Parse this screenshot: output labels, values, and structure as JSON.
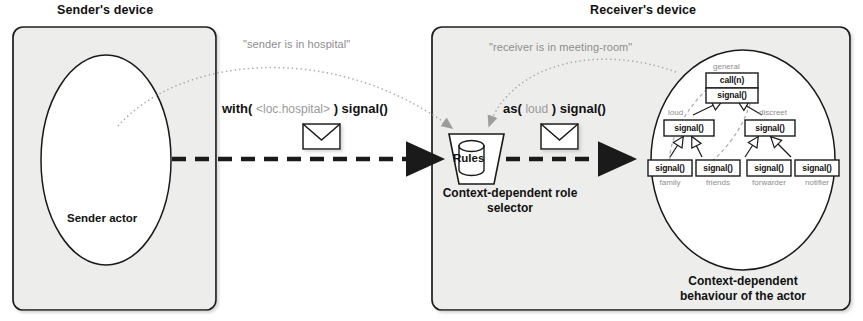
{
  "figure": {
    "sender_device_title": "Sender's device",
    "receiver_device_title": "Receiver's device",
    "sender_actor_label": "Sender actor",
    "selector_caption_line1": "Context-dependent role",
    "selector_caption_line2": "selector",
    "behaviour_caption_line1": "Context-dependent",
    "behaviour_caption_line2": "behaviour of the actor",
    "rules_label": "Rules"
  },
  "context_notes": [
    {
      "text": "\"sender is in hospital\""
    },
    {
      "text": "\"receiver is in meeting-room\""
    }
  ],
  "messages": [
    {
      "prefix": "with(",
      "argument": "<loc.hospital>",
      "suffix": ") signal()",
      "icon": "envelope-icon"
    },
    {
      "prefix": "as(",
      "argument": "loud",
      "suffix": ") signal()",
      "icon": "envelope-icon"
    }
  ],
  "role_hierarchy": {
    "root": {
      "role": "general",
      "operations": [
        "call(n)",
        "signal()"
      ]
    },
    "middle": [
      {
        "role": "loud",
        "operations": [
          "signal()"
        ]
      },
      {
        "role": "discreet",
        "operations": [
          "signal()"
        ]
      }
    ],
    "leaves": [
      {
        "role": "family",
        "operations": [
          "signal()"
        ]
      },
      {
        "role": "friends",
        "operations": [
          "signal()"
        ]
      },
      {
        "role": "forwarder",
        "operations": [
          "signal()"
        ]
      },
      {
        "role": "notifier",
        "operations": [
          "signal()"
        ]
      }
    ]
  },
  "colors": {
    "device_fill": "#ededec",
    "stroke": "#1a1a1a",
    "dotted": "#a9a9a9",
    "muted_text": "#8d8d8d",
    "paper": "#ffffff"
  }
}
